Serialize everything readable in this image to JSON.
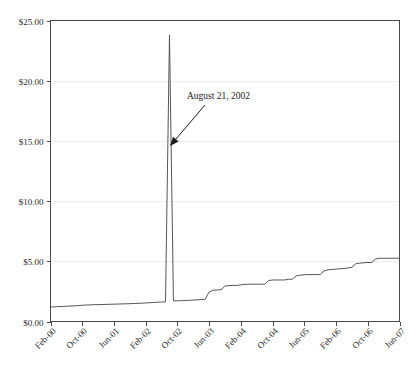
{
  "chart_data": {
    "type": "line",
    "title": "",
    "xlabel": "",
    "ylabel": "",
    "ylim": [
      0,
      25
    ],
    "ytick_values": [
      0,
      5,
      10,
      15,
      20,
      25
    ],
    "ytick_labels": [
      "$0.00",
      "$5.00",
      "$10.00",
      "$15.00",
      "$20.00",
      "$25.00"
    ],
    "xtick_labels": [
      "Feb-00",
      "Oct-00",
      "Jun-01",
      "Feb-02",
      "Oct-02",
      "Jun-03",
      "Feb-04",
      "Oct-04",
      "Jun-05",
      "Feb-06",
      "Oct-06",
      "Jun-07"
    ],
    "xtick_indices": [
      0,
      8,
      16,
      24,
      32,
      40,
      48,
      56,
      64,
      72,
      80,
      88
    ],
    "grid": true,
    "grid_axis": "y",
    "legend": "none",
    "line_color": "#555555",
    "annotations": [
      {
        "text": "August 21, 2002",
        "target_label": "Aug-02",
        "target_value": 23.8,
        "text_x": 187,
        "text_y": 99,
        "arrow_from_x": 205,
        "arrow_from_y": 105,
        "arrow_to_x": 170,
        "arrow_to_y": 146
      }
    ],
    "x": [
      "Feb-00",
      "Mar-00",
      "Apr-00",
      "May-00",
      "Jun-00",
      "Jul-00",
      "Aug-00",
      "Sep-00",
      "Oct-00",
      "Nov-00",
      "Dec-00",
      "Jan-01",
      "Feb-01",
      "Mar-01",
      "Apr-01",
      "May-01",
      "Jun-01",
      "Jul-01",
      "Aug-01",
      "Sep-01",
      "Oct-01",
      "Nov-01",
      "Dec-01",
      "Jan-02",
      "Feb-02",
      "Mar-02",
      "Apr-02",
      "May-02",
      "Jun-02",
      "Jul-02",
      "Aug-02",
      "Sep-02",
      "Oct-02",
      "Nov-02",
      "Dec-02",
      "Jan-03",
      "Feb-03",
      "Mar-03",
      "Apr-03",
      "May-03",
      "Jun-03",
      "Jul-03",
      "Aug-03",
      "Sep-03",
      "Oct-03",
      "Nov-03",
      "Dec-03",
      "Jan-04",
      "Feb-04",
      "Mar-04",
      "Apr-04",
      "May-04",
      "Jun-04",
      "Jul-04",
      "Aug-04",
      "Sep-04",
      "Oct-04",
      "Nov-04",
      "Dec-04",
      "Jan-05",
      "Feb-05",
      "Mar-05",
      "Apr-05",
      "May-05",
      "Jun-05",
      "Jul-05",
      "Aug-05",
      "Sep-05",
      "Oct-05",
      "Nov-05",
      "Dec-05",
      "Jan-06",
      "Feb-06",
      "Mar-06",
      "Apr-06",
      "May-06",
      "Jun-06",
      "Jul-06",
      "Aug-06",
      "Sep-06",
      "Oct-06",
      "Nov-06",
      "Dec-06",
      "Jan-07",
      "Feb-07",
      "Mar-07",
      "Apr-07",
      "May-07",
      "Jun-07"
    ],
    "values": [
      1.2,
      1.22,
      1.24,
      1.25,
      1.27,
      1.28,
      1.3,
      1.32,
      1.35,
      1.37,
      1.38,
      1.4,
      1.4,
      1.41,
      1.42,
      1.43,
      1.44,
      1.45,
      1.46,
      1.47,
      1.48,
      1.5,
      1.5,
      1.52,
      1.54,
      1.56,
      1.58,
      1.6,
      1.62,
      1.64,
      23.8,
      1.72,
      1.72,
      1.73,
      1.74,
      1.76,
      1.78,
      1.8,
      1.82,
      1.85,
      2.45,
      2.6,
      2.62,
      2.64,
      2.95,
      2.98,
      3.0,
      3.0,
      3.05,
      3.08,
      3.1,
      3.1,
      3.1,
      3.1,
      3.1,
      3.4,
      3.45,
      3.45,
      3.45,
      3.45,
      3.5,
      3.52,
      3.8,
      3.85,
      3.88,
      3.9,
      3.9,
      3.9,
      3.9,
      4.2,
      4.3,
      4.32,
      4.35,
      4.38,
      4.4,
      4.45,
      4.5,
      4.8,
      4.85,
      4.88,
      4.9,
      4.9,
      5.2,
      5.25,
      5.25,
      5.25,
      5.25,
      5.25,
      5.25
    ]
  }
}
